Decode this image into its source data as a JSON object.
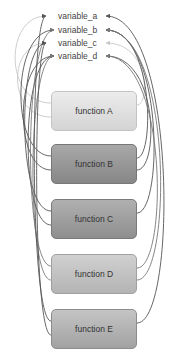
{
  "variables": [
    {
      "id": "a",
      "label": "variable_a",
      "y": 16
    },
    {
      "id": "b",
      "label": "variable_b",
      "y": 30
    },
    {
      "id": "c",
      "label": "variable_c",
      "y": 43
    },
    {
      "id": "d",
      "label": "variable_d",
      "y": 56
    }
  ],
  "functions": [
    {
      "id": "A",
      "label": "function A",
      "top": 91,
      "fill_top": "#ececec",
      "fill_bottom": "#d4d4d4",
      "border": "#c4c4c4",
      "line": "#c8c8c8"
    },
    {
      "id": "B",
      "label": "function B",
      "top": 144,
      "fill_top": "#a8a8a8",
      "fill_bottom": "#878787",
      "border": "#777777",
      "line": "#555555"
    },
    {
      "id": "C",
      "label": "function C",
      "top": 199,
      "fill_top": "#b0b0b0",
      "fill_bottom": "#8e8e8e",
      "border": "#7a7a7a",
      "line": "#555555"
    },
    {
      "id": "D",
      "label": "function D",
      "top": 254,
      "fill_top": "#d0d0d0",
      "fill_bottom": "#b4b4b4",
      "border": "#a0a0a0",
      "line": "#777777"
    },
    {
      "id": "E",
      "label": "function E",
      "top": 309,
      "fill_top": "#c4c4c4",
      "fill_bottom": "#a2a2a2",
      "border": "#8c8c8c",
      "line": "#555555"
    }
  ],
  "writes": [
    {
      "from": "A",
      "to": "a"
    },
    {
      "from": "A",
      "to": "c"
    },
    {
      "from": "B",
      "to": "b"
    },
    {
      "from": "B",
      "to": "d"
    },
    {
      "from": "C",
      "to": "c"
    },
    {
      "from": "C",
      "to": "d"
    },
    {
      "from": "D",
      "to": "b"
    },
    {
      "from": "D",
      "to": "d"
    },
    {
      "from": "E",
      "to": "a"
    },
    {
      "from": "E",
      "to": "c"
    }
  ],
  "reads": [
    {
      "from": "A",
      "to": "c"
    },
    {
      "from": "B",
      "to": "b"
    },
    {
      "from": "B",
      "to": "d"
    },
    {
      "from": "C",
      "to": "b"
    },
    {
      "from": "D",
      "to": "d"
    },
    {
      "from": "D",
      "to": "b"
    },
    {
      "from": "E",
      "to": "a"
    }
  ]
}
